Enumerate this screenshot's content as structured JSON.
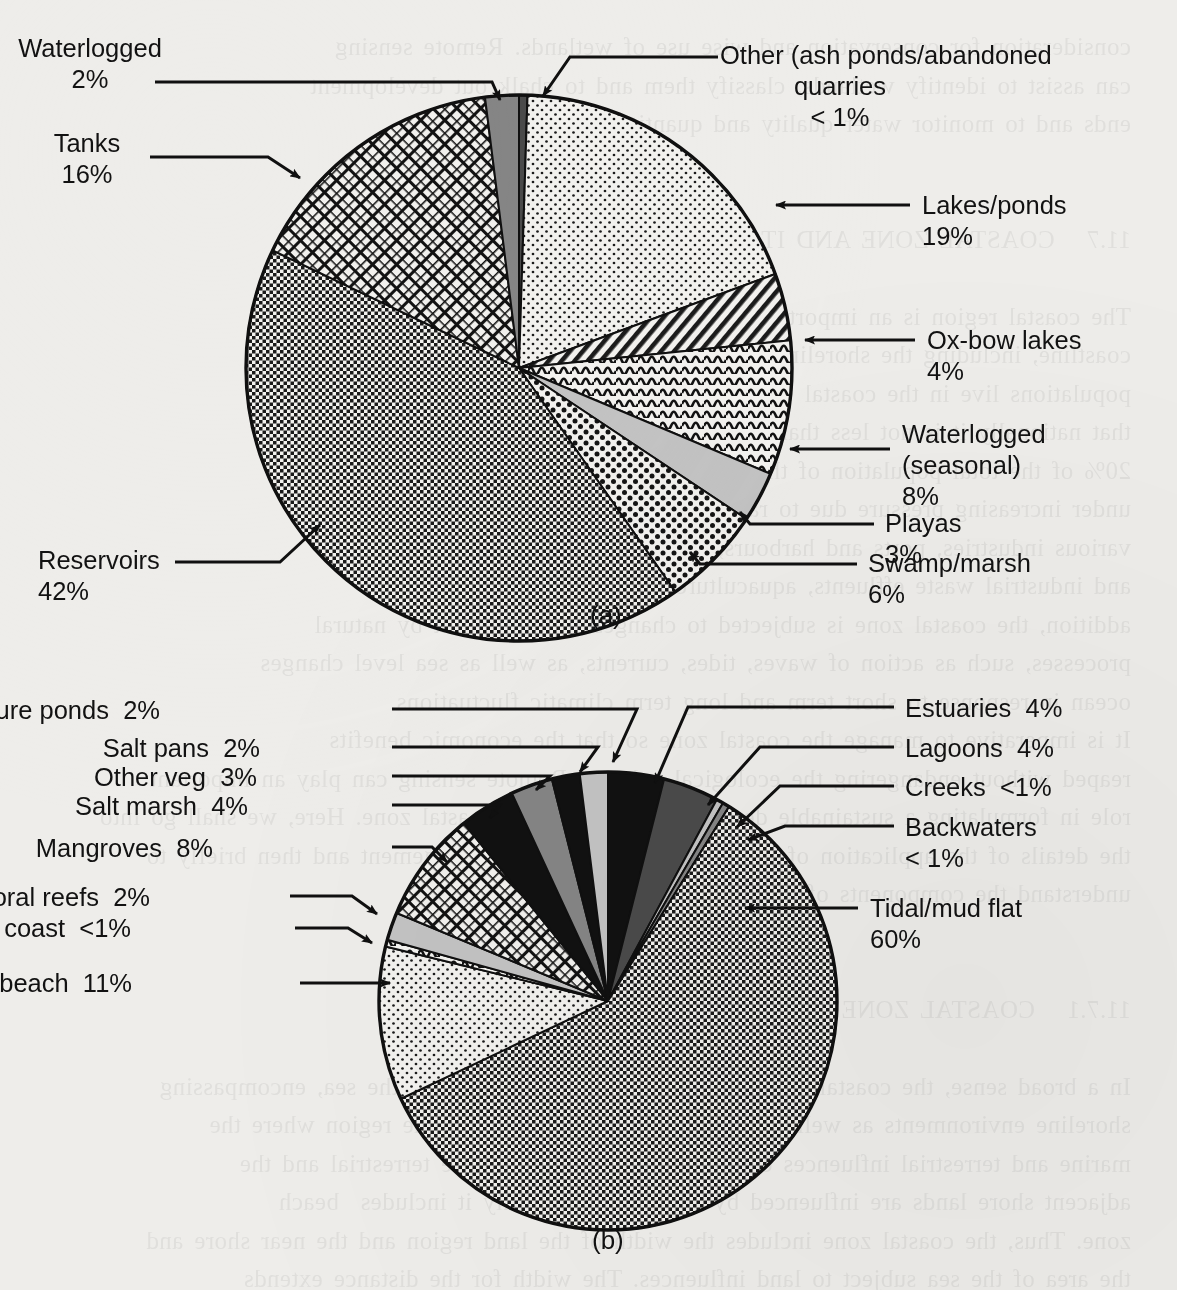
{
  "page": {
    "background_color": "#eeedea",
    "ink_color": "#121212",
    "showthrough_text": "consideration for conservation and wise use of wetlands. Remote sensing\ncan assist to identify wetlands, classify them and to chalk out development\nends and to monitor water quality and quantity of the resources.\n\n\n11.7   COASTAL ZONE AND ITS\n\nThe coastal region is an important ecological and productive  India's\ncoastline, including the shoreline of the islands, is one of the world's\npopulations live in the coastal belt, the coastal zone is the land surface and\nthat nationally it is not less than 20 per cent of the land area. In India about\n20% of the total population of the country lives in the coastal zone as\nunder increasing pressure due to rapid urbanisation and development of\nvarious industries, ports and harbours, discharge of municipal sewage\nand industrial waste effluents, aquaculture and tourism. In\naddition, the coastal zone is subjected to changes brought about by natural\nprocesses, such as action of waves, tides, currents, as well as sea level changes\nocean in response to short term and long term climatic fluctuations.\nIt is imperative to manage the coastal zone so that the economic benefits\nreaped without endangering the ecological balance. Remote sensing can play an important\nrole in formulating a sustainable development plan of the coastal zone. Here, we shall go into\nthe details of the application of remote sensing to coastal management and then briefly to\nunderstand the components of the coastal zone.\n\n\n11.7.1   COASTAL ZONE ECOSYSTEMS\n\nIn a broad sense, the coastal zone is the interface of the land and the sea, encompassing\nshoreline environments as well as adjacent coastal waters. It is the region where the\nmarine and terrestrial influences extend to the sea and near the terrestrial and the\nadjacent shore lands are influenced by the sea, and broadly it includes  beach\nzone. Thus, the coastal zone includes the width of the land region and the near shore and\nthe area of the sea subject to land influences. The width for the distance extends\ninwards the land and seaward of the coastline to include the tidal aspects of\nthe coastal zone. Coastal zones include a number of ecosystems, such\nas coral reefs, mangroves, seagrass beds, salt marshes, wetlands, deltas and\nestuaries. We will now try to understand these components.\n\nCoral is the ecological structure made of calcareous algae and other organisms.\nCorals are tiny carnivorous, invertebrate animals called polyps. There are two types of corals\nthe reef-building and a coral-like hermatypic corals (they inhabit shallow, tropical waters) and\n",
    "panel_tags": [
      {
        "id": "a",
        "text": "(a)",
        "x": 590,
        "y": 614
      },
      {
        "id": "b",
        "text": "(b)",
        "x": 592,
        "y": 1239
      }
    ]
  },
  "chart_data": [
    {
      "id": "chart-a",
      "type": "pie",
      "title": "",
      "panel_label": "(a)",
      "total_label": "",
      "center": {
        "x": 519,
        "y": 368
      },
      "radius": 273,
      "start_angle_deg": -90,
      "direction": "clockwise",
      "categories": [
        "Other (ash ponds/abandoned quarries)",
        "Lakes/ponds",
        "Ox-bow lakes",
        "Waterlogged (seasonal)",
        "Playas",
        "Swamp/marsh",
        "Reservoirs",
        "Tanks",
        "Waterlogged"
      ],
      "values": [
        0.5,
        19,
        4,
        8,
        3,
        6,
        42,
        16,
        2
      ],
      "value_labels": [
        "< 1%",
        "19%",
        "4%",
        "8%",
        "3%",
        "6%",
        "42%",
        "16%",
        "2%"
      ],
      "fills": [
        "dark-gray-solid",
        "fine-dot-light",
        "diagonal-hatch",
        "wavy-lines",
        "light-gray-solid",
        "coarse-dot",
        "fine-checker-dark",
        "diamond-crosshatch",
        "medium-gray-solid"
      ],
      "labels": [
        {
          "name": "other-ash-ponds",
          "line1": "Other (ash ponds/abandoned",
          "line2": "quarries",
          "line3": "< 1%",
          "align": "center",
          "x": 840,
          "y": 40,
          "leader": {
            "x1": 718,
            "y1": 57,
            "x2": 570,
            "y2": 57,
            "x3": 543,
            "y3": 96
          }
        },
        {
          "name": "lakes-ponds",
          "line1": "Lakes/ponds",
          "line2": "19%",
          "line3": "",
          "align": "left",
          "x": 922,
          "y": 190,
          "leader": {
            "x1": 910,
            "y1": 205,
            "x2": 776,
            "y2": 205,
            "x3": 776,
            "y3": 205
          }
        },
        {
          "name": "ox-bow-lakes",
          "line1": "Ox-bow lakes",
          "line2": "4%",
          "line3": "",
          "align": "left",
          "x": 927,
          "y": 325,
          "leader": {
            "x1": 915,
            "y1": 340,
            "x2": 805,
            "y2": 340,
            "x3": 805,
            "y3": 340
          }
        },
        {
          "name": "waterlogged-seasonal",
          "line1": "Waterlogged",
          "line2": "(seasonal)",
          "line3": "8%",
          "align": "left",
          "x": 902,
          "y": 419,
          "leader": {
            "x1": 890,
            "y1": 449,
            "x2": 790,
            "y2": 449,
            "x3": 790,
            "y3": 449
          }
        },
        {
          "name": "playas",
          "line1": "Playas",
          "line2": "3%",
          "line3": "",
          "align": "left",
          "x": 885,
          "y": 508,
          "leader": {
            "x1": 874,
            "y1": 524,
            "x2": 750,
            "y2": 524,
            "x3": 740,
            "y3": 512
          }
        },
        {
          "name": "swamp-marsh",
          "line1": "Swamp/marsh",
          "line2": "6%",
          "line3": "",
          "align": "left",
          "x": 868,
          "y": 548,
          "leader": {
            "x1": 857,
            "y1": 564,
            "x2": 700,
            "y2": 564,
            "x3": 690,
            "y3": 552
          }
        },
        {
          "name": "reservoirs",
          "line1": "Reservoirs",
          "line2": "42%",
          "line3": "",
          "align": "left",
          "x": 38,
          "y": 545,
          "leader": {
            "x1": 175,
            "y1": 562,
            "x2": 280,
            "y2": 562,
            "x3": 320,
            "y3": 525
          }
        },
        {
          "name": "tanks",
          "line1": "Tanks",
          "line2": "16%",
          "line3": "",
          "align": "center",
          "x": 87,
          "y": 128,
          "leader": {
            "x1": 150,
            "y1": 157,
            "x2": 268,
            "y2": 157,
            "x3": 300,
            "y3": 178
          }
        },
        {
          "name": "waterlogged",
          "line1": "Waterlogged",
          "line2": "2%",
          "line3": "",
          "align": "center",
          "x": 90,
          "y": 33,
          "leader": {
            "x1": 155,
            "y1": 82,
            "x2": 492,
            "y2": 82,
            "x3": 500,
            "y3": 100
          }
        }
      ]
    },
    {
      "id": "chart-b",
      "type": "pie",
      "title": "",
      "panel_label": "(b)",
      "center": {
        "x": 608,
        "y": 1001
      },
      "radius": 229,
      "start_angle_deg": -90,
      "direction": "clockwise",
      "categories": [
        "Estuaries",
        "Lagoons",
        "Creeks",
        "Backwaters",
        "Tidal/mud flat",
        "Sand/beach",
        "Rocky coast",
        "Coral reefs",
        "Mangroves",
        "Salt marsh",
        "Other veg",
        "Salt pans",
        "Aquaculture ponds"
      ],
      "values": [
        4,
        4,
        0.5,
        0.5,
        60,
        11,
        0.5,
        2,
        8,
        4,
        3,
        2,
        2
      ],
      "value_labels": [
        "4%",
        "4%",
        "<1%",
        "< 1%",
        "60%",
        "11%",
        "<1%",
        "2%",
        "8%",
        "4%",
        "3%",
        "2%",
        "2%"
      ],
      "fills": [
        "black-solid",
        "dark-gray-solid",
        "light-gray-solid",
        "medium-gray-solid",
        "fine-checker-dark",
        "fine-dot-light",
        "wavy-lines",
        "light-gray-solid",
        "diamond-crosshatch",
        "black-solid",
        "medium-gray-solid",
        "black-solid",
        "light-gray-solid"
      ],
      "labels": [
        {
          "name": "aquaculture-ponds",
          "text": "Aquaculture ponds  2%",
          "align": "right",
          "x": 160,
          "y": 695,
          "leader": {
            "x1": 392,
            "y1": 709,
            "x2": 637,
            "y2": 709,
            "x3": 613,
            "y3": 762
          }
        },
        {
          "name": "salt-pans",
          "text": "Salt pans  2%",
          "align": "right",
          "x": 260,
          "y": 733,
          "leader": {
            "x1": 392,
            "y1": 747,
            "x2": 598,
            "y2": 747,
            "x3": 580,
            "y3": 772
          }
        },
        {
          "name": "other-veg",
          "text": "Other veg  3%",
          "align": "right",
          "x": 257,
          "y": 762,
          "leader": {
            "x1": 392,
            "y1": 776,
            "x2": 550,
            "y2": 776,
            "x3": 536,
            "y3": 790
          }
        },
        {
          "name": "salt-marsh",
          "text": "Salt marsh  4%",
          "align": "right",
          "x": 248,
          "y": 791,
          "leader": {
            "x1": 392,
            "y1": 805,
            "x2": 500,
            "y2": 805,
            "x3": 490,
            "y3": 818
          }
        },
        {
          "name": "mangroves",
          "text": "Mangroves  8%",
          "align": "right",
          "x": 213,
          "y": 833,
          "leader": {
            "x1": 392,
            "y1": 847,
            "x2": 432,
            "y2": 847,
            "x3": 447,
            "y3": 862
          }
        },
        {
          "name": "coral-reefs",
          "text": "Coral reefs  2%",
          "align": "right",
          "x": 150,
          "y": 882,
          "leader": {
            "x1": 290,
            "y1": 896,
            "x2": 352,
            "y2": 896,
            "x3": 377,
            "y3": 914
          }
        },
        {
          "name": "rocky-coast",
          "text": "Rocky coast  <1%",
          "align": "right",
          "x": 131,
          "y": 913,
          "leader": {
            "x1": 295,
            "y1": 928,
            "x2": 348,
            "y2": 928,
            "x3": 372,
            "y3": 943
          }
        },
        {
          "name": "sand-beach",
          "text": "Sand/beach  11%",
          "align": "right",
          "x": 132,
          "y": 968,
          "leader": {
            "x1": 300,
            "y1": 983,
            "x2": 390,
            "y2": 983,
            "x3": 390,
            "y3": 983
          }
        },
        {
          "name": "estuaries",
          "text": "Estuaries  4%",
          "align": "left",
          "x": 905,
          "y": 693,
          "leader": {
            "x1": 894,
            "y1": 707,
            "x2": 688,
            "y2": 707,
            "x3": 655,
            "y3": 783
          }
        },
        {
          "name": "lagoons",
          "text": "Lagoons  4%",
          "align": "left",
          "x": 905,
          "y": 733,
          "leader": {
            "x1": 894,
            "y1": 747,
            "x2": 760,
            "y2": 747,
            "x3": 708,
            "y3": 805
          }
        },
        {
          "name": "creeks",
          "text": "Creeks  <1%",
          "align": "left",
          "x": 905,
          "y": 772,
          "leader": {
            "x1": 894,
            "y1": 786,
            "x2": 780,
            "y2": 786,
            "x3": 737,
            "y3": 827
          }
        },
        {
          "name": "backwaters",
          "line1": "Backwaters",
          "line2": "< 1%",
          "align": "left",
          "x": 905,
          "y": 812,
          "leader": {
            "x1": 894,
            "y1": 826,
            "x2": 785,
            "y2": 826,
            "x3": 748,
            "y3": 840
          }
        },
        {
          "name": "tidal-mud-flat",
          "line1": "Tidal/mud flat",
          "line2": "60%",
          "align": "left",
          "x": 870,
          "y": 893,
          "leader": {
            "x1": 858,
            "y1": 908,
            "x2": 745,
            "y2": 908,
            "x3": 745,
            "y3": 908
          }
        }
      ]
    }
  ]
}
